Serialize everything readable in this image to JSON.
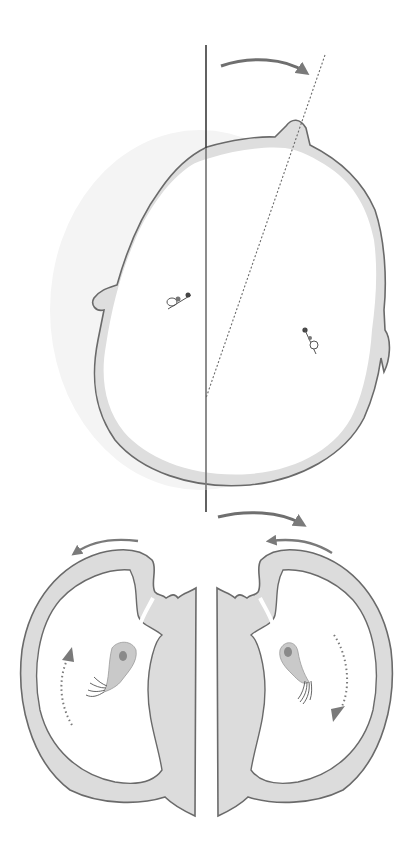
{
  "figure": {
    "type": "schematic-diagram",
    "text_labels": [],
    "panels": [
      {
        "id": "top",
        "description": "Embryo outline viewed from above with vertical midline and rotated tilted dashed axis; curved arrow shows clockwise rotation",
        "elements": [
          "vertical-midline",
          "tilted-dashed-axis",
          "rotation-arrow",
          "embryo-outline",
          "left-protrusion",
          "right-protrusion",
          "top-protrusion",
          "left-cilium-cell",
          "right-cilium-cell"
        ]
      },
      {
        "id": "bottom",
        "description": "Cross-section pair (left and right halves) showing cavities with ciliated cells and flow arrows",
        "elements": [
          "top-rotation-arrow",
          "left-counterclockwise-arrow",
          "right-counterclockwise-arrow",
          "left-cavity",
          "right-cavity",
          "left-ciliated-cell",
          "right-ciliated-cell",
          "left-dotted-flow-up",
          "right-dotted-flow-down"
        ]
      }
    ]
  },
  "colors": {
    "tissue_fill": "#dcdcdc",
    "outline": "#6a6a6a",
    "arrow": "#7a7a7a",
    "line": "#3a3a3a",
    "background": "#ffffff",
    "cell_fill": "#c8c8c8",
    "nucleus": "#8a8a8a"
  }
}
